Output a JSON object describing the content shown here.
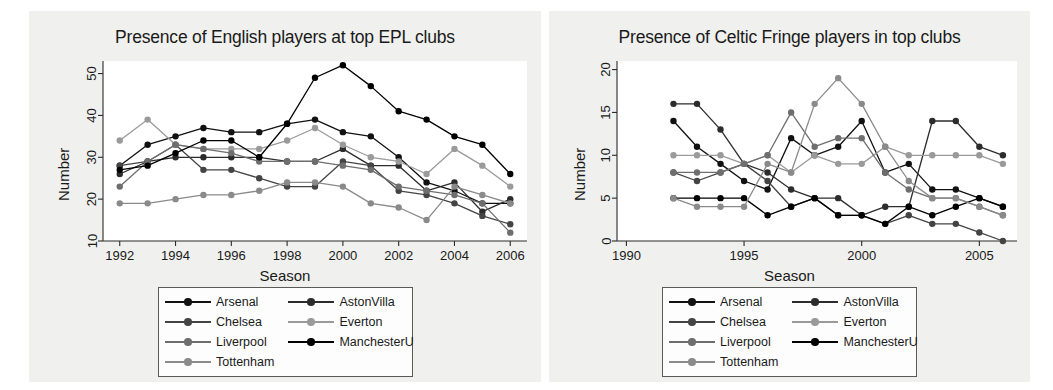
{
  "figure": {
    "background": "#ffffff",
    "panel_background": "#f0f0ee",
    "plot_background": "#ffffff"
  },
  "series_styles": [
    {
      "name": "Arsenal",
      "color": "#111111"
    },
    {
      "name": "AstonVilla",
      "color": "#2c2c2c"
    },
    {
      "name": "Chelsea",
      "color": "#444444"
    },
    {
      "name": "Everton",
      "color": "#9a9a9a"
    },
    {
      "name": "Liverpool",
      "color": "#6e6e6e"
    },
    {
      "name": "ManchesterU",
      "color": "#000000"
    },
    {
      "name": "Tottenham",
      "color": "#8a8a8a"
    }
  ],
  "legend": {
    "order": [
      "Arsenal",
      "AstonVilla",
      "Chelsea",
      "Everton",
      "Liverpool",
      "ManchesterU",
      "Tottenham"
    ],
    "entries": [
      {
        "label": "Arsenal",
        "color": "#111111"
      },
      {
        "label": "AstonVilla",
        "color": "#2c2c2c"
      },
      {
        "label": "Chelsea",
        "color": "#444444"
      },
      {
        "label": "Everton",
        "color": "#9a9a9a"
      },
      {
        "label": "Liverpool",
        "color": "#6e6e6e"
      },
      {
        "label": "ManchesterU",
        "color": "#000000"
      },
      {
        "label": "Tottenham",
        "color": "#8a8a8a"
      }
    ]
  },
  "chart_data": [
    {
      "id": "english-players",
      "type": "line",
      "title": "Presence of English players at top EPL clubs",
      "xlabel": "Season",
      "ylabel": "Number",
      "xlim": [
        1991.4,
        2006.6
      ],
      "ylim": [
        10,
        53
      ],
      "xticks": [
        1992,
        1994,
        1996,
        1998,
        2000,
        2002,
        2004,
        2006
      ],
      "yticks": [
        10,
        20,
        30,
        40,
        50
      ],
      "grid": false,
      "legend_position": "below",
      "x": [
        1992,
        1993,
        1994,
        1995,
        1996,
        1997,
        1998,
        1999,
        2000,
        2001,
        2002,
        2003,
        2004,
        2005,
        2006
      ],
      "series": [
        {
          "name": "Arsenal",
          "color": "#111111",
          "values": [
            28,
            33,
            35,
            37,
            36,
            36,
            38,
            39,
            36,
            35,
            30,
            24,
            22,
            19,
            19
          ]
        },
        {
          "name": "AstonVilla",
          "color": "#2c2c2c",
          "values": [
            26,
            29,
            30,
            30,
            30,
            30,
            29,
            29,
            32,
            28,
            28,
            22,
            24,
            17,
            20
          ]
        },
        {
          "name": "Chelsea",
          "color": "#444444",
          "values": [
            28,
            29,
            33,
            27,
            27,
            25,
            23,
            23,
            29,
            28,
            22,
            21,
            19,
            16,
            14
          ]
        },
        {
          "name": "Everton",
          "color": "#9a9a9a",
          "values": [
            34,
            39,
            33,
            32,
            32,
            32,
            34,
            37,
            33,
            30,
            29,
            26,
            32,
            28,
            23
          ]
        },
        {
          "name": "Liverpool",
          "color": "#6e6e6e",
          "values": [
            23,
            29,
            33,
            32,
            31,
            29,
            29,
            29,
            28,
            27,
            23,
            22,
            21,
            19,
            12
          ]
        },
        {
          "name": "ManchesterU",
          "color": "#000000",
          "values": [
            27,
            28,
            31,
            34,
            34,
            30,
            38,
            49,
            52,
            47,
            41,
            39,
            35,
            33,
            26
          ]
        },
        {
          "name": "Tottenham",
          "color": "#8a8a8a",
          "values": [
            19,
            19,
            20,
            21,
            21,
            22,
            24,
            24,
            23,
            19,
            18,
            15,
            23,
            21,
            19
          ]
        }
      ]
    },
    {
      "id": "celtic-fringe-players",
      "type": "line",
      "title": "Presence of Celtic Fringe players in top clubs",
      "xlabel": "Season",
      "ylabel": "Number",
      "xlim": [
        1989.6,
        2006.6
      ],
      "ylim": [
        0,
        21
      ],
      "xticks": [
        1990,
        1995,
        2000,
        2005
      ],
      "yticks": [
        0,
        5,
        10,
        15,
        20
      ],
      "grid": false,
      "legend_position": "below",
      "x": [
        1992,
        1993,
        1994,
        1995,
        1996,
        1997,
        1998,
        1999,
        2000,
        2001,
        2002,
        2003,
        2004,
        2005,
        2006
      ],
      "series": [
        {
          "name": "Arsenal",
          "color": "#111111",
          "values": [
            14,
            11,
            9,
            7,
            6,
            12,
            10,
            11,
            14,
            8,
            9,
            6,
            6,
            5,
            4
          ]
        },
        {
          "name": "AstonVilla",
          "color": "#2c2c2c",
          "values": [
            16,
            16,
            13,
            9,
            8,
            6,
            5,
            5,
            3,
            4,
            4,
            14,
            14,
            11,
            10
          ]
        },
        {
          "name": "Chelsea",
          "color": "#444444",
          "values": [
            8,
            7,
            8,
            9,
            7,
            4,
            5,
            3,
            3,
            2,
            3,
            2,
            2,
            1,
            0
          ]
        },
        {
          "name": "Everton",
          "color": "#9a9a9a",
          "values": [
            10,
            10,
            10,
            9,
            10,
            8,
            10,
            9,
            9,
            11,
            10,
            10,
            10,
            10,
            9
          ]
        },
        {
          "name": "Liverpool",
          "color": "#6e6e6e",
          "values": [
            8,
            8,
            8,
            9,
            10,
            15,
            11,
            12,
            12,
            8,
            6,
            5,
            5,
            4,
            3
          ]
        },
        {
          "name": "ManchesterU",
          "color": "#000000",
          "values": [
            5,
            5,
            5,
            5,
            3,
            4,
            5,
            3,
            3,
            2,
            4,
            3,
            4,
            5,
            4
          ]
        },
        {
          "name": "Tottenham",
          "color": "#8a8a8a",
          "values": [
            5,
            4,
            4,
            4,
            9,
            8,
            16,
            19,
            16,
            11,
            7,
            5,
            5,
            4,
            3
          ]
        }
      ]
    }
  ]
}
